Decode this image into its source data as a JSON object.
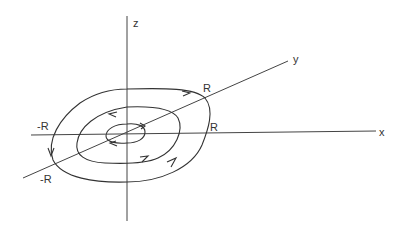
{
  "diagram": {
    "type": "3d-axes-with-concentric-orbits",
    "axes": {
      "x_label": "x",
      "y_label": "y",
      "z_label": "z"
    },
    "radius_labels": {
      "y_positive": "R",
      "x_positive": "R",
      "x_negative": "-R",
      "y_negative": "-R"
    },
    "orbits": [
      {
        "name": "inner-orbit",
        "direction": "counter-clockwise"
      },
      {
        "name": "middle-orbit",
        "direction": "counter-clockwise"
      },
      {
        "name": "outer-orbit",
        "direction": "counter-clockwise"
      }
    ],
    "colors": {
      "line": "#333333",
      "background": "#ffffff"
    }
  }
}
